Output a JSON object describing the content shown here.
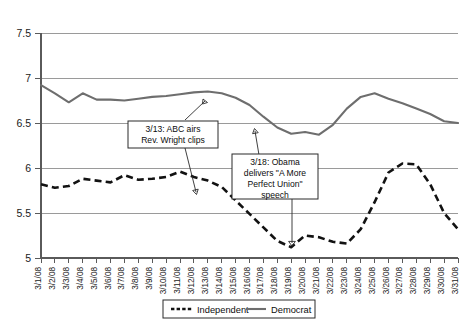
{
  "chart_data": {
    "type": "line",
    "title": "",
    "subtitle": "",
    "xlabel": "",
    "ylabel": "",
    "ylim": [
      5,
      7.5
    ],
    "y_ticks": [
      "5",
      "5.5",
      "6",
      "6.5",
      "7",
      "7.5"
    ],
    "grid": true,
    "legend_position": "bottom",
    "categories": [
      "3/1/08",
      "3/2/08",
      "3/3/08",
      "3/4/08",
      "3/5/08",
      "3/6/08",
      "3/7/08",
      "3/8/08",
      "3/9/08",
      "3/10/08",
      "3/11/08",
      "3/12/08",
      "3/13/08",
      "3/14/08",
      "3/15/08",
      "3/16/08",
      "3/17/08",
      "3/18/08",
      "3/19/08",
      "3/20/08",
      "3/21/08",
      "3/22/08",
      "3/23/08",
      "3/24/08",
      "3/25/08",
      "3/26/08",
      "3/27/08",
      "3/28/08",
      "3/29/08",
      "3/30/08",
      "3/31/08"
    ],
    "series": [
      {
        "name": "Independent",
        "style": "dashed",
        "color": "#121212",
        "values": [
          5.82,
          5.78,
          5.8,
          5.88,
          5.86,
          5.84,
          5.92,
          5.87,
          5.88,
          5.9,
          5.96,
          5.9,
          5.86,
          5.79,
          5.64,
          5.49,
          5.34,
          5.19,
          5.12,
          5.25,
          5.23,
          5.18,
          5.16,
          5.32,
          5.62,
          5.95,
          6.05,
          6.04,
          5.82,
          5.5,
          5.32
        ]
      },
      {
        "name": "Democrat",
        "style": "solid",
        "color": "#6e6e6e",
        "values": [
          6.92,
          6.83,
          6.73,
          6.83,
          6.76,
          6.76,
          6.75,
          6.77,
          6.79,
          6.8,
          6.82,
          6.84,
          6.85,
          6.83,
          6.78,
          6.7,
          6.57,
          6.45,
          6.38,
          6.4,
          6.37,
          6.48,
          6.66,
          6.79,
          6.83,
          6.77,
          6.72,
          6.66,
          6.6,
          6.52,
          6.5
        ]
      }
    ],
    "annotations": [
      {
        "id": "annotation-wright",
        "lines": [
          "3/13: ABC  airs",
          "Rev. Wright clips"
        ],
        "points_to": [
          "3/13/08 Democrat",
          "3/13/08 Independent"
        ]
      },
      {
        "id": "annotation-speech",
        "lines": [
          "3/18: Obama",
          "delivers \"A More",
          "Perfect Union\"",
          "speech"
        ],
        "points_to": [
          "3/18/08 Democrat",
          "3/18/08 Independent"
        ]
      }
    ],
    "legend": [
      {
        "label": "Independent",
        "style": "dashed"
      },
      {
        "label": "Democrat",
        "style": "solid"
      }
    ]
  }
}
